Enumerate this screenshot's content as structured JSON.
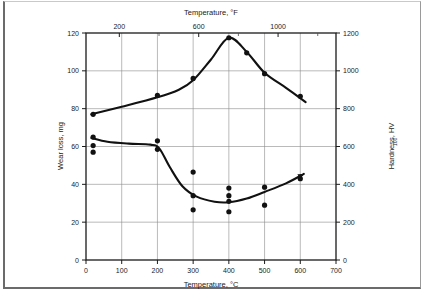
{
  "figure": {
    "background_color": "#ffffff",
    "frame_color": "#6b6b6b",
    "series_color": "#111111",
    "grid_color": "#8c8c8c"
  },
  "axes": {
    "bottom": {
      "title": "Temperature, °C",
      "ticks": [
        "0",
        "100",
        "200",
        "300",
        "400",
        "500",
        "600",
        "700"
      ],
      "tick_values": [
        0,
        100,
        200,
        300,
        400,
        500,
        600,
        700
      ],
      "range": [
        0,
        700
      ]
    },
    "top": {
      "title": "Temperature, °F",
      "ticks": [
        "200",
        "600",
        "1000"
      ],
      "tick_values_f": [
        200,
        600,
        1000
      ],
      "tick_values_c": [
        93.3,
        315.6,
        537.8
      ],
      "minor_tick_values_f": [
        400,
        800,
        1200
      ],
      "range_f": [
        32,
        1292
      ]
    },
    "left": {
      "title": "Wear loss, mg",
      "ticks": [
        "0",
        "20",
        "40",
        "60",
        "80",
        "100",
        "120"
      ],
      "tick_values": [
        0,
        20,
        40,
        60,
        80,
        100,
        120
      ],
      "range": [
        0,
        120
      ]
    },
    "right": {
      "title_main": "Hardness, HV",
      "title_sub": "100",
      "ticks": [
        "0",
        "200",
        "400",
        "600",
        "800",
        "1000",
        "1200"
      ],
      "tick_values": [
        0,
        200,
        400,
        600,
        800,
        1000,
        1200
      ],
      "range": [
        0,
        1200
      ]
    }
  },
  "chart_data": {
    "type": "scatter",
    "title": "",
    "xlabel": "Temperature, °C",
    "ylabel": "Wear loss, mg",
    "y2label": "Hardness, HV100",
    "xlim": [
      0,
      700
    ],
    "ylim": [
      0,
      120
    ],
    "y2lim": [
      0,
      1200
    ],
    "grid": true,
    "legend": "none",
    "series": [
      {
        "name": "Hardness, HV100",
        "axis": "right",
        "marker": "filled-circle",
        "points": [
          {
            "x": 20,
            "y_left": 77,
            "y_right": 770
          },
          {
            "x": 200,
            "y_left": 87,
            "y_right": 870
          },
          {
            "x": 300,
            "y_left": 96,
            "y_right": 960
          },
          {
            "x": 400,
            "y_left": 117.5,
            "y_right": 1175
          },
          {
            "x": 450,
            "y_left": 109.5,
            "y_right": 1095
          },
          {
            "x": 500,
            "y_left": 98.5,
            "y_right": 985
          },
          {
            "x": 600,
            "y_left": 86.5,
            "y_right": 865
          }
        ],
        "curve": [
          {
            "x": 15,
            "y_left": 77
          },
          {
            "x": 100,
            "y_left": 81
          },
          {
            "x": 200,
            "y_left": 86
          },
          {
            "x": 260,
            "y_left": 90
          },
          {
            "x": 300,
            "y_left": 95
          },
          {
            "x": 350,
            "y_left": 106
          },
          {
            "x": 400,
            "y_left": 117.5
          },
          {
            "x": 450,
            "y_left": 110
          },
          {
            "x": 500,
            "y_left": 99
          },
          {
            "x": 560,
            "y_left": 91
          },
          {
            "x": 615,
            "y_left": 83.5
          }
        ]
      },
      {
        "name": "Wear loss, mg",
        "axis": "left",
        "marker": "filled-circle",
        "points": [
          {
            "x": 20,
            "y_left": 65
          },
          {
            "x": 20,
            "y_left": 60.5
          },
          {
            "x": 20,
            "y_left": 57
          },
          {
            "x": 200,
            "y_left": 63
          },
          {
            "x": 200,
            "y_left": 58.5
          },
          {
            "x": 300,
            "y_left": 46.5
          },
          {
            "x": 300,
            "y_left": 34
          },
          {
            "x": 300,
            "y_left": 26.5
          },
          {
            "x": 400,
            "y_left": 38
          },
          {
            "x": 400,
            "y_left": 34
          },
          {
            "x": 400,
            "y_left": 31
          },
          {
            "x": 400,
            "y_left": 25.5
          },
          {
            "x": 500,
            "y_left": 38.5
          },
          {
            "x": 500,
            "y_left": 29
          },
          {
            "x": 600,
            "y_left": 43
          }
        ],
        "curve": [
          {
            "x": 15,
            "y_left": 64.5
          },
          {
            "x": 60,
            "y_left": 62.5
          },
          {
            "x": 120,
            "y_left": 61.5
          },
          {
            "x": 180,
            "y_left": 61
          },
          {
            "x": 205,
            "y_left": 59
          },
          {
            "x": 235,
            "y_left": 49
          },
          {
            "x": 270,
            "y_left": 39
          },
          {
            "x": 310,
            "y_left": 33.5
          },
          {
            "x": 360,
            "y_left": 30.8
          },
          {
            "x": 400,
            "y_left": 30.5
          },
          {
            "x": 450,
            "y_left": 32.5
          },
          {
            "x": 500,
            "y_left": 36
          },
          {
            "x": 560,
            "y_left": 40.5
          },
          {
            "x": 610,
            "y_left": 45.5
          }
        ],
        "has_arrow_end": true
      }
    ]
  }
}
